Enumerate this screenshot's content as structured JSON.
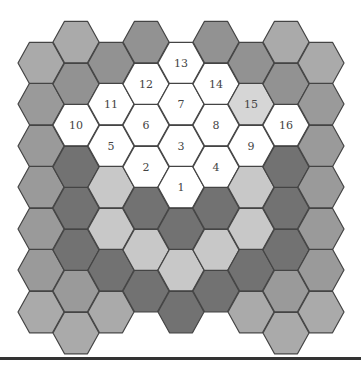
{
  "diagram": {
    "type": "hexagonal-grid",
    "orientation": "flat-top",
    "hex_radius": 23,
    "column_x": [
      41,
      76,
      111,
      146,
      181,
      216,
      251,
      286,
      321
    ],
    "colors": {
      "W": "#ffffff",
      "P": "#d6d6d6",
      "L": "#c8c8c8",
      "M": "#aaaaaa",
      "N": "#9a9a9a",
      "S": "#929292",
      "D": "#727272"
    },
    "stroke": "#444444",
    "columns": [
      {
        "cells": [
          {
            "y": 63,
            "fill": "M"
          },
          {
            "y": 104,
            "fill": "N"
          },
          {
            "y": 146,
            "fill": "N"
          },
          {
            "y": 187,
            "fill": "N"
          },
          {
            "y": 229,
            "fill": "N"
          },
          {
            "y": 270,
            "fill": "N"
          },
          {
            "y": 312,
            "fill": "M"
          }
        ]
      },
      {
        "cells": [
          {
            "y": 42,
            "fill": "M"
          },
          {
            "y": 84,
            "fill": "S"
          },
          {
            "y": 125,
            "fill": "W",
            "label": "10"
          },
          {
            "y": 167,
            "fill": "D"
          },
          {
            "y": 208,
            "fill": "D"
          },
          {
            "y": 250,
            "fill": "D"
          },
          {
            "y": 291,
            "fill": "N"
          },
          {
            "y": 333,
            "fill": "M"
          }
        ]
      },
      {
        "cells": [
          {
            "y": 63,
            "fill": "S"
          },
          {
            "y": 104,
            "fill": "W",
            "label": "11"
          },
          {
            "y": 146,
            "fill": "W",
            "label": "5"
          },
          {
            "y": 187,
            "fill": "L"
          },
          {
            "y": 229,
            "fill": "L"
          },
          {
            "y": 270,
            "fill": "D"
          },
          {
            "y": 312,
            "fill": "M"
          }
        ]
      },
      {
        "cells": [
          {
            "y": 42,
            "fill": "S"
          },
          {
            "y": 84,
            "fill": "W",
            "label": "12"
          },
          {
            "y": 125,
            "fill": "W",
            "label": "6"
          },
          {
            "y": 167,
            "fill": "W",
            "label": "2"
          },
          {
            "y": 208,
            "fill": "D"
          },
          {
            "y": 250,
            "fill": "L"
          },
          {
            "y": 291,
            "fill": "D"
          }
        ]
      },
      {
        "cells": [
          {
            "y": 63,
            "fill": "W",
            "label": "13"
          },
          {
            "y": 104,
            "fill": "W",
            "label": "7"
          },
          {
            "y": 146,
            "fill": "W",
            "label": "3"
          },
          {
            "y": 187,
            "fill": "W",
            "label": "1"
          },
          {
            "y": 229,
            "fill": "D"
          },
          {
            "y": 270,
            "fill": "L"
          },
          {
            "y": 312,
            "fill": "D"
          }
        ]
      },
      {
        "cells": [
          {
            "y": 42,
            "fill": "S"
          },
          {
            "y": 84,
            "fill": "W",
            "label": "14"
          },
          {
            "y": 125,
            "fill": "W",
            "label": "8"
          },
          {
            "y": 167,
            "fill": "W",
            "label": "4"
          },
          {
            "y": 208,
            "fill": "D"
          },
          {
            "y": 250,
            "fill": "L"
          },
          {
            "y": 291,
            "fill": "D"
          }
        ]
      },
      {
        "cells": [
          {
            "y": 63,
            "fill": "S"
          },
          {
            "y": 104,
            "fill": "P",
            "label": "15"
          },
          {
            "y": 146,
            "fill": "W",
            "label": "9"
          },
          {
            "y": 187,
            "fill": "L"
          },
          {
            "y": 229,
            "fill": "L"
          },
          {
            "y": 270,
            "fill": "D"
          },
          {
            "y": 312,
            "fill": "M"
          }
        ]
      },
      {
        "cells": [
          {
            "y": 42,
            "fill": "M"
          },
          {
            "y": 84,
            "fill": "S"
          },
          {
            "y": 125,
            "fill": "W",
            "label": "16"
          },
          {
            "y": 167,
            "fill": "D"
          },
          {
            "y": 208,
            "fill": "D"
          },
          {
            "y": 250,
            "fill": "D"
          },
          {
            "y": 291,
            "fill": "N"
          },
          {
            "y": 333,
            "fill": "M"
          }
        ]
      },
      {
        "cells": [
          {
            "y": 63,
            "fill": "M"
          },
          {
            "y": 104,
            "fill": "N"
          },
          {
            "y": 146,
            "fill": "N"
          },
          {
            "y": 187,
            "fill": "N"
          },
          {
            "y": 229,
            "fill": "N"
          },
          {
            "y": 270,
            "fill": "N"
          },
          {
            "y": 312,
            "fill": "M"
          }
        ]
      }
    ],
    "numbered_cells": [
      "1",
      "2",
      "3",
      "4",
      "5",
      "6",
      "7",
      "8",
      "9",
      "10",
      "11",
      "12",
      "13",
      "14",
      "15",
      "16"
    ],
    "rule_color": "#333333"
  }
}
